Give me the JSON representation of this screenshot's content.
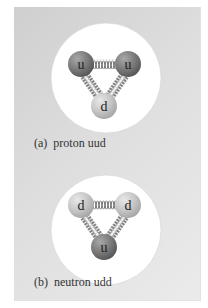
{
  "figure": {
    "panels": [
      {
        "id": "a",
        "caption": "(a)  proton uud",
        "particle": "proton",
        "quarks": [
          {
            "label": "u",
            "flavor": "up"
          },
          {
            "label": "u",
            "flavor": "up"
          },
          {
            "label": "d",
            "flavor": "down"
          }
        ]
      },
      {
        "id": "b",
        "caption": "(b)  neutron udd",
        "particle": "neutron",
        "quarks": [
          {
            "label": "d",
            "flavor": "down"
          },
          {
            "label": "d",
            "flavor": "down"
          },
          {
            "label": "u",
            "flavor": "up"
          }
        ]
      }
    ],
    "colors": {
      "background_panel": "#d8d8d8",
      "hadron_circle": "#ffffff",
      "up_quark": "#7c7c7c",
      "down_quark": "#c4c4c4",
      "spring": "#555555",
      "text": "#333333"
    }
  }
}
